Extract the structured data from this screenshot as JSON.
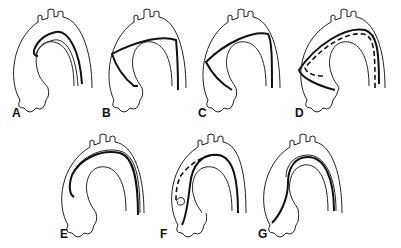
{
  "figure": {
    "panels": [
      {
        "id": "A",
        "label": "A",
        "description": "wire along greater curvature, tip in descending aorta"
      },
      {
        "id": "B",
        "label": "B",
        "description": "wire crossing ascending aorta to lateral wall"
      },
      {
        "id": "C",
        "label": "C",
        "description": "wire prolapsed against ascending aorta wall"
      },
      {
        "id": "D",
        "label": "D",
        "description": "wire looped in ascending aorta with dashed catheter"
      },
      {
        "id": "E",
        "label": "E",
        "description": "wire along outer curvature ending in ascending aorta"
      },
      {
        "id": "F",
        "label": "F",
        "description": "dashed catheter with loop at aortic root"
      },
      {
        "id": "G",
        "label": "G",
        "description": "wire along inner curvature into ascending aorta"
      }
    ]
  }
}
